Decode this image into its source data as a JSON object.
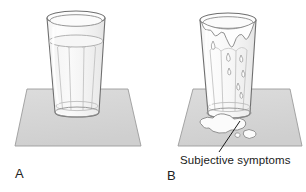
{
  "figure": {
    "width": 306,
    "height": 192,
    "background": "#ffffff"
  },
  "panels": [
    {
      "id": "A",
      "label": "A",
      "description": "glass of water resting on a mat, liquid level below rim, no overflow",
      "mat": {
        "fill": "#d6d6d6",
        "stroke": "#9a9a9a",
        "points": "27,89 128,89 141,146 15,146"
      },
      "glass": {
        "stroke": "#6f6f6f",
        "fill": "#fbfbfb",
        "rim_cx": 76,
        "rim_cy": 18,
        "rim_rx": 29,
        "rim_ry": 6.5,
        "base_cx": 77,
        "base_cy": 112,
        "base_rx": 22,
        "base_ry": 5
      },
      "water": {
        "surface_cy": 41,
        "surface_rx": 27,
        "surface_ry": 6,
        "fill": "#f4f4f4",
        "stroke": "#a8a8a8"
      }
    },
    {
      "id": "B",
      "label": "B",
      "description": "same glass overfilled, liquid overflowing the rim, drips running down the side and a puddle pooled on the mat",
      "mat": {
        "fill": "#d6d6d6",
        "stroke": "#9a9a9a",
        "points": "193,89 290,89 302,146 178,146"
      },
      "glass": {
        "stroke": "#6f6f6f",
        "fill": "#fbfbfb",
        "rim_cx": 228,
        "rim_cy": 20,
        "rim_rx": 28,
        "rim_ry": 6.5,
        "base_cx": 229,
        "base_cy": 113,
        "base_rx": 22,
        "base_ry": 5
      },
      "overflow": {
        "fill": "#fdfdfd",
        "stroke": "#8a8a8a",
        "drip_count": 7
      },
      "puddle": {
        "fill": "#fbfbfb",
        "stroke": "#8a8a8a",
        "cx": 230,
        "cy": 128
      }
    }
  ],
  "annotations": [
    {
      "name": "subjective-symptoms",
      "text": "Subjective symptoms",
      "leader_from": [
        220,
        152
      ],
      "leader_to": [
        240,
        122
      ],
      "stroke": "#1a1a1a"
    }
  ],
  "colors": {
    "mat_fill": "#d6d6d6",
    "mat_stroke": "#9a9a9a",
    "glass_stroke": "#6f6f6f",
    "liquid_stroke": "#a8a8a8",
    "text": "#1a1a1a",
    "background": "#ffffff"
  }
}
